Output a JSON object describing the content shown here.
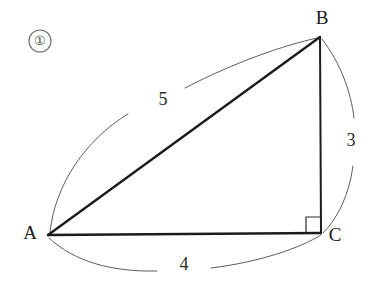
{
  "figure": {
    "problem_number": "①",
    "type": "right-triangle",
    "background_color": "#ffffff",
    "stroke_color": "#1c1c1c",
    "arc_color": "#5d5d5d",
    "vertices": [
      {
        "name": "A",
        "label": "A",
        "x": 48,
        "y": 235,
        "label_x": 30,
        "label_y": 235
      },
      {
        "name": "B",
        "label": "B",
        "x": 320,
        "y": 37,
        "label_x": 322,
        "label_y": 20
      },
      {
        "name": "C",
        "label": "C",
        "x": 321,
        "y": 233,
        "label_x": 335,
        "label_y": 237
      }
    ],
    "sides": [
      {
        "name": "AB",
        "measure": "5",
        "label_x": 163,
        "label_y": 101
      },
      {
        "name": "BC",
        "measure": "3",
        "label_x": 351,
        "label_y": 142
      },
      {
        "name": "AC",
        "measure": "4",
        "label_x": 184,
        "label_y": 266
      }
    ],
    "right_angle": {
      "at_vertex": "C",
      "size": 15
    }
  }
}
